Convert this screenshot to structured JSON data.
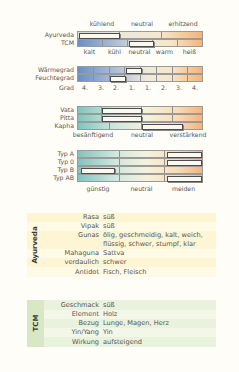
{
  "thermal_chart": {
    "top_labels": [
      "kühlend",
      "neutral",
      "erhitzend"
    ],
    "rows": [
      {
        "label": "Ayurveda",
        "columns": 3,
        "bar_start_col": 0,
        "bar_end_col": 1
      },
      {
        "label": "TCM",
        "columns": 5,
        "bar_start_col": 2,
        "bar_end_col": 3
      }
    ],
    "bottom_labels": [
      "kalt",
      "kühl",
      "neutral",
      "warm",
      "heiß"
    ]
  },
  "grade_chart": {
    "rows": [
      {
        "label": "Wärmegrad",
        "bar_col": 3
      },
      {
        "label": "Feuchtegrad",
        "bar_col": 2
      }
    ],
    "axis_label": "Grad",
    "ticks": [
      "4.",
      "3.",
      "2.",
      "1.",
      "1.",
      "2.",
      "3.",
      "4."
    ]
  },
  "dosha_chart": {
    "rows": [
      {
        "label": "Vata",
        "bar_from": 0.19,
        "bar_to": 0.51
      },
      {
        "label": "Pitta",
        "bar_from": 0.19,
        "bar_to": 0.51
      },
      {
        "label": "Kapha",
        "bar_from": 0.51,
        "bar_to": 0.83
      }
    ],
    "bottom_labels": [
      "besänftigend",
      "neutral",
      "verstärkend"
    ]
  },
  "bloodtype_chart": {
    "rows": [
      {
        "label": "Typ A",
        "rating": "meiden"
      },
      {
        "label": "Typ 0",
        "rating": "meiden"
      },
      {
        "label": "Typ B",
        "rating": "günstig"
      },
      {
        "label": "Typ AB",
        "rating": "meiden"
      }
    ],
    "bottom_labels": [
      "günstig",
      "neutral",
      "meiden"
    ]
  },
  "ayurveda_table": {
    "title": "Ayurveda",
    "rows": [
      {
        "key": "Rasa",
        "value": "süß"
      },
      {
        "key": "Vipak",
        "value": "süß"
      },
      {
        "key": "Gunas",
        "value": "ölig, geschmeidig, kalt, weich,",
        "value2": "flüssig, schwer, stumpf, klar"
      },
      {
        "key": "Mahaguna",
        "value": "Sattva"
      },
      {
        "key": "verdaulich",
        "value": "schwer"
      },
      {
        "key": "Antidot",
        "value": "Fisch, Fleisch"
      }
    ]
  },
  "tcm_table": {
    "title": "TCM",
    "rows": [
      {
        "key": "Geschmack",
        "value": "süß"
      },
      {
        "key": "Element",
        "value": "Holz"
      },
      {
        "key": "Bezug",
        "value": "Lunge, Magen, Herz"
      },
      {
        "key": "Yin/Yang",
        "value": "Yin"
      },
      {
        "key": "Wirkung",
        "value": "aufsteigend"
      }
    ]
  },
  "colors": {
    "cool": "#6b8fc5",
    "neutral": "#f5f2df",
    "warm": "#f3b47b",
    "teal": "#7fc5bf",
    "ayurveda_bg": "#fdf5d4",
    "tcm_bg": "#e9f2dc"
  }
}
